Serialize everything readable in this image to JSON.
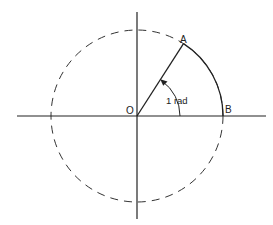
{
  "diagram": {
    "center": {
      "x": 137,
      "y": 116
    },
    "radius": 86,
    "angle_rad": 1,
    "colors": {
      "stroke": "#222222",
      "background": "#ffffff"
    },
    "labels": {
      "origin": "O",
      "point_a": "A",
      "point_b": "B",
      "angle": "1 rad"
    },
    "elements": {
      "x_axis": {
        "x1": 17,
        "x2": 266
      },
      "y_axis": {
        "y1": 12,
        "y2": 219
      },
      "dashed_circle": "full circle of radius r centered at O",
      "solid_arc": "arc AB of length r on the circle",
      "radius_line": "OA",
      "angle_marker": "arc with arrow from OB to OA"
    }
  }
}
